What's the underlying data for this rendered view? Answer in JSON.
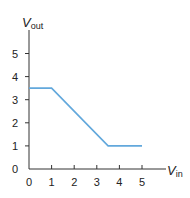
{
  "chart_data": {
    "type": "line",
    "title": "",
    "xlabel": "V_in",
    "ylabel": "V_out",
    "xlabel_main": "V",
    "xlabel_sub": "in",
    "ylabel_main": "V",
    "ylabel_sub": "out",
    "x_ticks": [
      "0",
      "1",
      "2",
      "3",
      "4",
      "5"
    ],
    "y_ticks": [
      "0",
      "1",
      "2",
      "3",
      "4",
      "5"
    ],
    "xlim": [
      0,
      6
    ],
    "ylim": [
      0,
      6
    ],
    "grid": false,
    "series": [
      {
        "name": "V_out",
        "color": "#62a8dc",
        "x": [
          0,
          1,
          3.5,
          5
        ],
        "y": [
          3.5,
          3.5,
          1,
          1
        ]
      }
    ]
  }
}
